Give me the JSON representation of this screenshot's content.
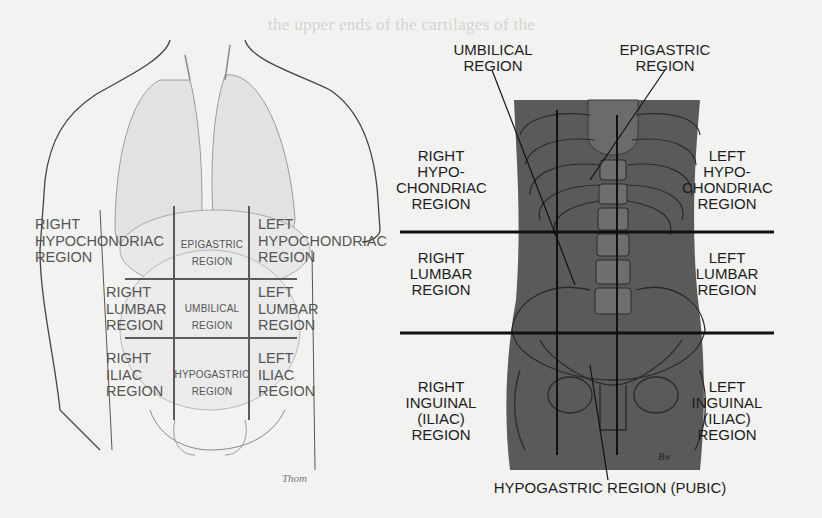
{
  "figure": {
    "left_panel": {
      "title": "Nine abdominal regions over organ illustration",
      "regions": [
        {
          "id": "right-hypochondriac",
          "label": "RIGHT\nHYPOCHONDRIAC\nREGION"
        },
        {
          "id": "epigastric",
          "label": "EPIGASTRIC\nREGION"
        },
        {
          "id": "left-hypochondriac",
          "label": "LEFT\nHYPOCHONDRIAC\nREGION"
        },
        {
          "id": "right-lumbar",
          "label": "RIGHT\nLUMBAR\nREGION"
        },
        {
          "id": "umbilical",
          "label": "UMBILICAL\nREGION"
        },
        {
          "id": "left-lumbar",
          "label": "LEFT\nLUMBAR\nREGION"
        },
        {
          "id": "right-iliac",
          "label": "RIGHT\nILIAC\nREGION"
        },
        {
          "id": "hypogastric",
          "label": "HYPOGASTRIC\nREGION"
        },
        {
          "id": "left-iliac",
          "label": "LEFT\nILIAC\nREGION"
        }
      ],
      "signature": "Thom"
    },
    "right_panel": {
      "title": "Nine abdominal regions over skeletal illustration",
      "callouts": {
        "umbilical": "UMBILICAL\nREGION",
        "epigastric": "EPIGASTRIC\nREGION",
        "hypogastric": "HYPOGASTRIC REGION (PUBIC)"
      },
      "regions": {
        "right_hypochondriac": "RIGHT\nHYPO-\nCHONDRIAC\nREGION",
        "left_hypochondriac": "LEFT\nHYPO-\nCHONDRIAC\nREGION",
        "right_lumbar": "RIGHT\nLUMBAR\nREGION",
        "left_lumbar": "LEFT\nLUMBAR\nREGION",
        "right_inguinal": "RIGHT\nINGUINAL\n(ILIAC)\nREGION",
        "left_inguinal": "LEFT\nINGUINAL\n(ILIAC)\nREGION"
      },
      "signature": "Bw",
      "body_color": "#5a5a5a"
    },
    "bleed_through_text": [
      "the upper ends of the cartilages of the",
      "ventral ones and coinciding with",
      "the lower border of the two abdominal",
      "recti",
      "abdominal regions are sometimes referred",
      "to as the hypochondriac and the abdomina-",
      "l regions of the body ... indications",
      "of its contents as follows: the",
      "shows ... some important",
      "stomach ... nine, and ... the",
      "middle ... lines ...",
      "abdomen ... is ... the"
    ]
  }
}
